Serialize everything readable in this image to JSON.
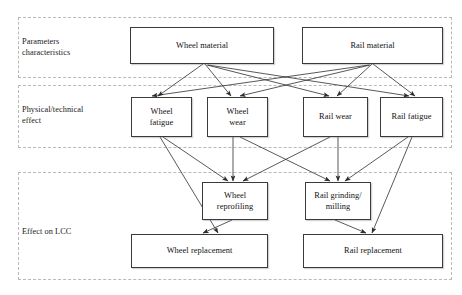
{
  "diagram": {
    "canvas": {
      "width": 462,
      "height": 295
    },
    "panels": [
      {
        "id": "panel-parameters",
        "label": "Parameters\ncharacteristics",
        "x": 18,
        "y": 17,
        "w": 434,
        "h": 61,
        "label_x": 22,
        "label_y": 36
      },
      {
        "id": "panel-physical",
        "label": "Physical/technical\neffect",
        "x": 18,
        "y": 85,
        "w": 434,
        "h": 63,
        "label_x": 22,
        "label_y": 104
      },
      {
        "id": "panel-lcc",
        "label": "Effect on LCC",
        "x": 18,
        "y": 172,
        "w": 434,
        "h": 108,
        "label_x": 22,
        "label_y": 226
      }
    ],
    "nodes": [
      {
        "id": "wheel-material",
        "label": "Wheel material",
        "x": 130,
        "y": 27,
        "w": 144,
        "h": 37
      },
      {
        "id": "rail-material",
        "label": "Rail material",
        "x": 302,
        "y": 27,
        "w": 141,
        "h": 37
      },
      {
        "id": "wheel-fatigue",
        "label": "Wheel\nfatigue",
        "x": 131,
        "y": 97,
        "w": 61,
        "h": 40
      },
      {
        "id": "wheel-wear",
        "label": "Wheel\nwear",
        "x": 207,
        "y": 97,
        "w": 61,
        "h": 40
      },
      {
        "id": "rail-wear",
        "label": "Rail wear",
        "x": 303,
        "y": 97,
        "w": 65,
        "h": 40
      },
      {
        "id": "rail-fatigue",
        "label": "Rail fatigue",
        "x": 380,
        "y": 97,
        "w": 63,
        "h": 40
      },
      {
        "id": "wheel-reprofiling",
        "label": "Wheel\nreprofiling",
        "x": 202,
        "y": 182,
        "w": 66,
        "h": 38
      },
      {
        "id": "rail-grinding",
        "label": "Rail grinding/\nmilling",
        "x": 305,
        "y": 182,
        "w": 66,
        "h": 38
      },
      {
        "id": "wheel-replacement",
        "label": "Wheel replacement",
        "x": 131,
        "y": 234,
        "w": 137,
        "h": 34
      },
      {
        "id": "rail-replacement",
        "label": "Rail replacement",
        "x": 303,
        "y": 234,
        "w": 140,
        "h": 34
      }
    ],
    "edges": [
      {
        "from": "wheel-material",
        "to": "wheel-fatigue",
        "x1": 203,
        "y1": 64,
        "x2": 158,
        "y2": 96
      },
      {
        "from": "wheel-material",
        "to": "wheel-wear",
        "x1": 205,
        "y1": 64,
        "x2": 231,
        "y2": 96
      },
      {
        "from": "wheel-material",
        "to": "rail-wear",
        "x1": 207,
        "y1": 65,
        "x2": 329,
        "y2": 96
      },
      {
        "from": "wheel-material",
        "to": "rail-fatigue",
        "x1": 208,
        "y1": 65,
        "x2": 409,
        "y2": 96
      },
      {
        "from": "rail-material",
        "to": "wheel-fatigue",
        "x1": 369,
        "y1": 65,
        "x2": 152,
        "y2": 96
      },
      {
        "from": "rail-material",
        "to": "wheel-wear",
        "x1": 370,
        "y1": 65,
        "x2": 240,
        "y2": 96
      },
      {
        "from": "rail-material",
        "to": "rail-wear",
        "x1": 372,
        "y1": 64,
        "x2": 337,
        "y2": 96
      },
      {
        "from": "rail-material",
        "to": "rail-fatigue",
        "x1": 373,
        "y1": 64,
        "x2": 415,
        "y2": 96
      },
      {
        "from": "wheel-fatigue",
        "to": "wheel-reprofiling",
        "x1": 163,
        "y1": 137,
        "x2": 228,
        "y2": 181
      },
      {
        "from": "wheel-fatigue",
        "to": "wheel-replacement",
        "x1": 160,
        "y1": 137,
        "x2": 218,
        "y2": 233
      },
      {
        "from": "wheel-wear",
        "to": "wheel-reprofiling",
        "x1": 233,
        "y1": 137,
        "x2": 233,
        "y2": 181
      },
      {
        "from": "wheel-wear",
        "to": "rail-grinding",
        "x1": 240,
        "y1": 137,
        "x2": 330,
        "y2": 181
      },
      {
        "from": "rail-wear",
        "to": "rail-grinding",
        "x1": 338,
        "y1": 137,
        "x2": 338,
        "y2": 181
      },
      {
        "from": "rail-wear",
        "to": "wheel-reprofiling",
        "x1": 330,
        "y1": 137,
        "x2": 243,
        "y2": 181
      },
      {
        "from": "rail-fatigue",
        "to": "rail-grinding",
        "x1": 408,
        "y1": 137,
        "x2": 345,
        "y2": 181
      },
      {
        "from": "rail-fatigue",
        "to": "rail-replacement",
        "x1": 412,
        "y1": 137,
        "x2": 372,
        "y2": 233
      },
      {
        "from": "wheel-reprofiling",
        "to": "wheel-replacement",
        "x1": 232,
        "y1": 220,
        "x2": 203,
        "y2": 233
      },
      {
        "from": "rail-grinding",
        "to": "rail-replacement",
        "x1": 335,
        "y1": 220,
        "x2": 366,
        "y2": 233
      }
    ],
    "edge_color": "#2e2e2e"
  }
}
